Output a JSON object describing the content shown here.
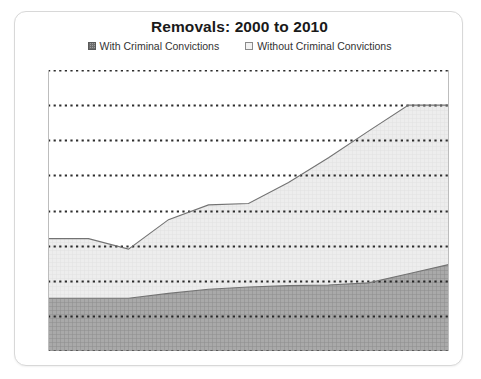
{
  "card": {
    "title": "Removals: 2000 to 2010"
  },
  "legend": {
    "position": "top-center",
    "items": [
      {
        "label": "With Criminal Convictions",
        "swatch": "dark-hatched-square-icon",
        "color": "#9d9d9d"
      },
      {
        "label": "Without Criminal Convictions",
        "swatch": "light-outlined-square-icon",
        "color": "#ececec"
      }
    ]
  },
  "chart_data": {
    "type": "area",
    "stacked": true,
    "title": "Removals: 2000 to 2010",
    "xlabel": "",
    "ylabel": "",
    "x": [
      2000,
      2001,
      2002,
      2003,
      2004,
      2005,
      2006,
      2007,
      2008,
      2009,
      2010
    ],
    "categories": [
      "2000",
      "2001",
      "2002",
      "2003",
      "2004",
      "2005",
      "2006",
      "2007",
      "2008",
      "2009",
      "2010"
    ],
    "series": [
      {
        "name": "With Criminal Convictions",
        "values": [
          75000,
          75000,
          75000,
          82000,
          88000,
          91000,
          93000,
          94000,
          97000,
          110000,
          123000
        ]
      },
      {
        "name": "Without Criminal Convictions",
        "values": [
          85000,
          85000,
          70000,
          105000,
          120000,
          119000,
          147000,
          181000,
          216000,
          240000,
          227000
        ]
      }
    ],
    "totals": [
      160000,
      160000,
      145000,
      187000,
      208000,
      210000,
      240000,
      275000,
      313000,
      350000,
      350000
    ],
    "ylim": [
      0,
      400000
    ],
    "yticks": [
      0,
      50000,
      100000,
      150000,
      200000,
      250000,
      300000,
      350000,
      400000
    ],
    "ytick_labels": [
      "",
      "",
      "",
      "",
      "",
      "",
      "",
      "",
      ""
    ],
    "xtick_labels": [
      "",
      "",
      "",
      "",
      "",
      "",
      "",
      "",
      "",
      "",
      ""
    ],
    "grid": true,
    "grid_style": "dotted-horizontal",
    "axis_labels_visible": false,
    "legend_position": "top-center"
  }
}
